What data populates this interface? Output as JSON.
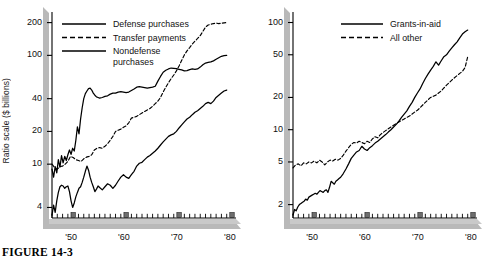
{
  "figure": {
    "caption": "FIGURE 14-3"
  },
  "chart_data": [
    {
      "id": "left",
      "type": "line",
      "title": "",
      "xlabel": "",
      "ylabel": "Ratio scale ($ billions)",
      "yscale": "log",
      "ylim": [
        3.2,
        230
      ],
      "yticks": [
        4,
        10,
        20,
        40,
        100,
        200
      ],
      "ytick_labels": [
        "4",
        "10",
        "20",
        "40",
        "100",
        "200"
      ],
      "xlim": [
        1946,
        1980
      ],
      "xticks": [
        1950,
        1960,
        1970,
        1980
      ],
      "xtick_labels": [
        "'50",
        "'60",
        "'70",
        "'80"
      ],
      "grid": false,
      "legend_position": "top-left",
      "series": [
        {
          "name": "Defense purchases",
          "style": "solid",
          "x": [
            1946.0,
            1946.3,
            1946.6,
            1946.9,
            1947.2,
            1947.5,
            1947.8,
            1948.1,
            1948.4,
            1948.7,
            1949.0,
            1949.3,
            1949.6,
            1949.9,
            1950.2,
            1950.5,
            1950.8,
            1951.1,
            1951.4,
            1951.7,
            1952.0,
            1952.3,
            1952.6,
            1952.9,
            1953.2,
            1953.5,
            1953.8,
            1954.1,
            1954.4,
            1954.7,
            1955.0,
            1955.5,
            1956.0,
            1956.5,
            1957.0,
            1957.5,
            1958.0,
            1958.5,
            1959.0,
            1959.5,
            1960.0,
            1960.5,
            1961.0,
            1961.5,
            1962.0,
            1962.5,
            1963.0,
            1963.5,
            1964.0,
            1964.5,
            1965.0,
            1965.5,
            1966.0,
            1966.5,
            1967.0,
            1967.5,
            1968.0,
            1968.5,
            1969.0,
            1969.5,
            1970.0,
            1970.5,
            1971.0,
            1971.5,
            1972.0,
            1972.5,
            1973.0,
            1973.5,
            1974.0,
            1974.5,
            1975.0,
            1975.5,
            1976.0,
            1976.5,
            1977.0,
            1977.5,
            1978.0,
            1978.5,
            1979.0
          ],
          "y": [
            9.0,
            7.6,
            9.5,
            8.3,
            11.0,
            9.4,
            12.0,
            10.3,
            11.8,
            10.8,
            12.2,
            13.5,
            12.3,
            14.0,
            13.2,
            16.5,
            22.0,
            19.0,
            26.0,
            33.0,
            40.0,
            44.5,
            47.0,
            49.5,
            50.0,
            48.0,
            45.0,
            43.0,
            41.5,
            41.0,
            40.5,
            41.0,
            42.0,
            42.5,
            44.0,
            45.0,
            45.0,
            46.0,
            46.5,
            46.0,
            45.5,
            46.0,
            47.5,
            49.0,
            51.0,
            51.5,
            51.0,
            50.5,
            50.0,
            50.5,
            51.0,
            52.0,
            58.0,
            64.0,
            70.0,
            73.0,
            75.0,
            76.5,
            76.0,
            75.5,
            74.5,
            73.5,
            72.0,
            72.5,
            74.0,
            75.0,
            74.5,
            75.0,
            78.0,
            82.0,
            85.0,
            86.0,
            87.0,
            89.0,
            92.0,
            95.0,
            98.0,
            99.5,
            100.0
          ]
        },
        {
          "name": "Transfer payments",
          "style": "dashed",
          "x": [
            1946.0,
            1946.5,
            1947.0,
            1947.5,
            1948.0,
            1948.5,
            1949.0,
            1949.5,
            1950.0,
            1950.5,
            1951.0,
            1951.5,
            1952.0,
            1952.5,
            1953.0,
            1953.5,
            1954.0,
            1954.5,
            1955.0,
            1955.5,
            1956.0,
            1956.5,
            1957.0,
            1957.5,
            1958.0,
            1958.5,
            1959.0,
            1959.5,
            1960.0,
            1960.5,
            1961.0,
            1961.5,
            1962.0,
            1962.5,
            1963.0,
            1963.5,
            1964.0,
            1964.5,
            1965.0,
            1965.5,
            1966.0,
            1966.5,
            1967.0,
            1967.5,
            1968.0,
            1968.5,
            1969.0,
            1969.5,
            1970.0,
            1970.5,
            1971.0,
            1971.5,
            1972.0,
            1972.5,
            1973.0,
            1973.5,
            1974.0,
            1974.5,
            1975.0,
            1975.5,
            1976.0,
            1976.5,
            1977.0,
            1977.5,
            1978.0,
            1978.5,
            1979.0
          ],
          "y": [
            10.0,
            9.3,
            9.0,
            9.5,
            9.6,
            10.0,
            10.6,
            11.8,
            11.5,
            11.0,
            10.8,
            10.6,
            11.2,
            11.6,
            11.8,
            12.2,
            13.5,
            14.0,
            14.2,
            14.0,
            14.6,
            15.4,
            16.6,
            18.0,
            20.0,
            20.5,
            21.0,
            21.8,
            22.5,
            24.0,
            26.5,
            27.0,
            27.5,
            28.5,
            29.5,
            30.5,
            31.5,
            32.5,
            34.0,
            36.0,
            38.0,
            41.0,
            46.0,
            51.0,
            56.0,
            61.0,
            66.0,
            72.0,
            80.0,
            90.0,
            101.0,
            110.0,
            118.0,
            127.0,
            135.0,
            143.0,
            152.0,
            166.0,
            182.0,
            190.0,
            193.0,
            196.0,
            198.0,
            196.0,
            197.0,
            199.0,
            200.0
          ]
        },
        {
          "name": "Nondefense purchases",
          "style": "solid",
          "x": [
            1946.0,
            1946.3,
            1946.6,
            1946.9,
            1947.2,
            1947.5,
            1947.8,
            1948.1,
            1948.4,
            1948.7,
            1949.0,
            1949.3,
            1949.6,
            1949.9,
            1950.2,
            1950.5,
            1950.8,
            1951.1,
            1951.4,
            1951.7,
            1952.0,
            1952.3,
            1952.6,
            1952.9,
            1953.2,
            1953.5,
            1953.8,
            1954.1,
            1954.4,
            1954.7,
            1955.0,
            1955.5,
            1956.0,
            1956.5,
            1957.0,
            1957.5,
            1958.0,
            1958.5,
            1959.0,
            1959.5,
            1960.0,
            1960.5,
            1961.0,
            1961.5,
            1962.0,
            1962.5,
            1963.0,
            1963.5,
            1964.0,
            1964.5,
            1965.0,
            1965.5,
            1966.0,
            1966.5,
            1967.0,
            1967.5,
            1968.0,
            1968.5,
            1969.0,
            1969.5,
            1970.0,
            1970.5,
            1971.0,
            1971.5,
            1972.0,
            1972.5,
            1973.0,
            1973.5,
            1974.0,
            1974.5,
            1975.0,
            1975.5,
            1976.0,
            1976.5,
            1977.0,
            1977.5,
            1978.0,
            1978.5,
            1979.0
          ],
          "y": [
            3.4,
            4.2,
            3.6,
            4.6,
            5.5,
            6.2,
            6.4,
            6.3,
            6.0,
            6.2,
            6.3,
            5.6,
            4.6,
            4.0,
            4.4,
            5.0,
            5.5,
            6.0,
            6.2,
            6.8,
            7.6,
            8.6,
            9.6,
            8.8,
            7.6,
            6.8,
            6.2,
            5.6,
            5.9,
            6.3,
            6.1,
            5.8,
            6.2,
            6.6,
            6.4,
            6.0,
            6.4,
            7.0,
            7.6,
            8.0,
            7.6,
            7.4,
            8.0,
            8.6,
            9.6,
            10.2,
            10.4,
            11.0,
            11.6,
            12.0,
            12.6,
            13.2,
            14.0,
            15.0,
            16.0,
            17.0,
            18.0,
            18.6,
            19.0,
            20.0,
            21.5,
            23.0,
            24.5,
            26.0,
            27.0,
            28.5,
            30.0,
            31.0,
            32.5,
            34.0,
            36.0,
            37.0,
            36.0,
            38.0,
            41.0,
            43.0,
            45.0,
            47.0,
            48.0
          ]
        }
      ]
    },
    {
      "id": "right",
      "type": "line",
      "title": "",
      "xlabel": "",
      "ylabel": "Ratio scale ($ billions)",
      "yscale": "log",
      "ylim": [
        1.5,
        115
      ],
      "yticks": [
        2,
        5,
        10,
        20,
        50,
        100
      ],
      "ytick_labels": [
        "2",
        "5",
        "10",
        "20",
        "50",
        "100"
      ],
      "xlim": [
        1946,
        1980
      ],
      "xticks": [
        1950,
        1960,
        1970,
        1980
      ],
      "xtick_labels": [
        "'50",
        "'60",
        "'70",
        "'80"
      ],
      "grid": false,
      "legend_position": "top-center",
      "series": [
        {
          "name": "Grants-in-aid",
          "style": "solid",
          "x": [
            1946.0,
            1946.3,
            1946.6,
            1946.9,
            1947.2,
            1947.5,
            1947.8,
            1948.1,
            1948.4,
            1948.7,
            1949.0,
            1949.3,
            1949.6,
            1949.9,
            1950.2,
            1950.5,
            1950.8,
            1951.1,
            1951.4,
            1951.7,
            1952.0,
            1952.3,
            1952.6,
            1952.9,
            1953.2,
            1953.5,
            1953.8,
            1954.1,
            1954.4,
            1954.7,
            1955.0,
            1955.5,
            1956.0,
            1956.5,
            1957.0,
            1957.5,
            1958.0,
            1958.5,
            1959.0,
            1959.5,
            1960.0,
            1960.5,
            1961.0,
            1961.5,
            1962.0,
            1962.5,
            1963.0,
            1963.5,
            1964.0,
            1964.5,
            1965.0,
            1965.5,
            1966.0,
            1966.5,
            1967.0,
            1967.5,
            1968.0,
            1968.5,
            1969.0,
            1969.5,
            1970.0,
            1970.5,
            1971.0,
            1971.5,
            1972.0,
            1972.5,
            1973.0,
            1973.5,
            1974.0,
            1974.5,
            1975.0,
            1975.5,
            1976.0,
            1976.5,
            1977.0,
            1977.5,
            1978.0,
            1978.5,
            1979.0
          ],
          "y": [
            1.6,
            1.8,
            1.75,
            1.9,
            2.0,
            2.05,
            2.1,
            2.15,
            2.25,
            2.2,
            2.35,
            2.4,
            2.45,
            2.5,
            2.55,
            2.5,
            2.6,
            2.7,
            2.65,
            2.6,
            2.7,
            2.75,
            2.6,
            2.9,
            3.3,
            3.2,
            3.1,
            3.3,
            3.4,
            3.5,
            3.6,
            3.9,
            4.3,
            4.8,
            5.4,
            5.8,
            6.2,
            6.4,
            7.0,
            6.6,
            6.4,
            6.8,
            7.1,
            7.5,
            7.8,
            8.2,
            8.6,
            9.0,
            9.5,
            10.0,
            10.6,
            11.2,
            12.0,
            13.0,
            14.0,
            15.0,
            16.5,
            18.0,
            20.0,
            22.0,
            24.0,
            27.0,
            30.0,
            33.0,
            36.0,
            39.0,
            43.0,
            40.0,
            44.0,
            48.0,
            50.0,
            54.0,
            58.0,
            62.0,
            66.0,
            72.0,
            78.0,
            82.0,
            85.0
          ]
        },
        {
          "name": "All other",
          "style": "dashed",
          "x": [
            1946.0,
            1946.5,
            1947.0,
            1947.5,
            1948.0,
            1948.5,
            1949.0,
            1949.5,
            1950.0,
            1950.5,
            1951.0,
            1951.5,
            1952.0,
            1952.5,
            1953.0,
            1953.5,
            1954.0,
            1954.5,
            1955.0,
            1955.5,
            1956.0,
            1956.5,
            1957.0,
            1957.5,
            1958.0,
            1958.5,
            1959.0,
            1959.5,
            1960.0,
            1960.5,
            1961.0,
            1961.5,
            1962.0,
            1962.5,
            1963.0,
            1963.5,
            1964.0,
            1964.5,
            1965.0,
            1965.5,
            1966.0,
            1966.5,
            1967.0,
            1967.5,
            1968.0,
            1968.5,
            1969.0,
            1969.5,
            1970.0,
            1970.5,
            1971.0,
            1971.5,
            1972.0,
            1972.5,
            1973.0,
            1973.5,
            1974.0,
            1974.5,
            1975.0,
            1975.5,
            1976.0,
            1976.5,
            1977.0,
            1977.5,
            1978.0,
            1978.5,
            1979.0
          ],
          "y": [
            4.4,
            4.7,
            4.8,
            4.6,
            4.9,
            4.8,
            5.0,
            4.9,
            5.1,
            4.9,
            5.2,
            5.0,
            4.7,
            5.0,
            5.2,
            5.1,
            5.3,
            5.2,
            5.4,
            5.8,
            6.3,
            6.8,
            7.3,
            7.6,
            7.5,
            7.8,
            7.6,
            7.4,
            7.8,
            7.6,
            8.2,
            8.6,
            8.4,
            9.0,
            9.4,
            9.8,
            10.2,
            10.6,
            11.0,
            11.4,
            11.8,
            12.2,
            12.6,
            13.0,
            13.4,
            14.0,
            14.6,
            15.2,
            16.0,
            17.0,
            18.0,
            19.0,
            20.0,
            20.5,
            21.0,
            22.0,
            23.0,
            24.5,
            26.0,
            27.5,
            29.0,
            30.5,
            32.0,
            33.5,
            35.0,
            38.0,
            48.0
          ]
        }
      ]
    }
  ]
}
